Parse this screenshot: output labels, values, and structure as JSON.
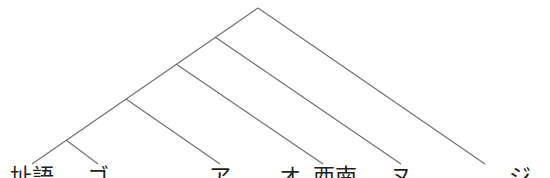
{
  "diagram": {
    "type": "cladogram",
    "line_color": "#6e6e6e",
    "root": {
      "x": 258,
      "y": 8
    },
    "internal_nodes": [
      {
        "id": "n1",
        "x": 215,
        "y": 37
      },
      {
        "id": "n2",
        "x": 176,
        "y": 64
      },
      {
        "id": "n3",
        "x": 126,
        "y": 99
      },
      {
        "id": "n4",
        "x": 66,
        "y": 140
      }
    ],
    "edges": [
      {
        "from": [
          258,
          8
        ],
        "to": [
          32,
          164
        ]
      },
      {
        "from": [
          258,
          8
        ],
        "to": [
          485,
          164
        ]
      },
      {
        "from": [
          215,
          37
        ],
        "to": [
          401,
          164
        ]
      },
      {
        "from": [
          176,
          64
        ],
        "to": [
          323,
          164
        ]
      },
      {
        "from": [
          126,
          99
        ],
        "to": [
          220,
          164
        ]
      },
      {
        "from": [
          66,
          140
        ],
        "to": [
          98,
          164
        ]
      }
    ],
    "leaves": [
      {
        "label": "址語",
        "x": 32
      },
      {
        "label": "ゴ",
        "x": 98
      },
      {
        "label": "ア",
        "x": 220
      },
      {
        "label": "オ",
        "x": 290
      },
      {
        "label": "西南",
        "x": 323
      },
      {
        "label": "ヌ",
        "x": 401
      },
      {
        "label": "ジ",
        "x": 520
      }
    ],
    "note": "Leaf labels are clipped at the bottom edge of the image"
  }
}
